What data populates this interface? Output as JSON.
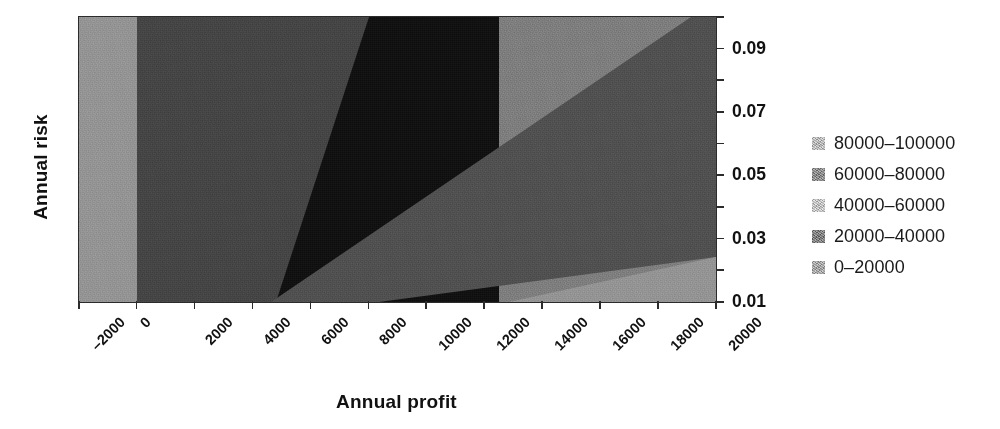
{
  "chart_data": {
    "type": "heatmap",
    "subtype": "filled-contour",
    "title": "",
    "xlabel": "Annual profit",
    "ylabel": "Annual risk",
    "xlim": [
      -2000,
      20000
    ],
    "ylim": [
      0.01,
      0.1
    ],
    "grid": false,
    "y_axis_position": "right",
    "x_tick_rotation": -45,
    "xticks": [
      "-2000",
      "0",
      "2000",
      "4000",
      "6000",
      "8000",
      "10000",
      "12000",
      "14000",
      "16000",
      "18000",
      "20000"
    ],
    "xtick_values": [
      -2000,
      0,
      2000,
      4000,
      6000,
      8000,
      10000,
      12000,
      14000,
      16000,
      18000,
      20000
    ],
    "yticks": [
      "0.01",
      "0.03",
      "0.05",
      "0.07",
      "0.09"
    ],
    "ytick_values": [
      0.01,
      0.03,
      0.05,
      0.07,
      0.09
    ],
    "yminor_values": [
      0.02,
      0.04,
      0.06,
      0.08,
      0.1
    ],
    "zlabel": "Expected value",
    "levels": [
      0,
      20000,
      40000,
      60000,
      80000,
      100000
    ],
    "band_colors": [
      "#969696",
      "#444444",
      "#7f7f7f",
      "#4f4f4f",
      "#0e0e0e"
    ],
    "legend_position": "right",
    "legend": [
      {
        "label": "80000–100000",
        "color": "#cfcfcf",
        "range": [
          80000,
          100000
        ]
      },
      {
        "label": "60000–80000",
        "color": "#8d8d8d",
        "range": [
          60000,
          80000
        ]
      },
      {
        "label": "40000–60000",
        "color": "#dcdcdc",
        "range": [
          40000,
          60000
        ]
      },
      {
        "label": "20000–40000",
        "color": "#7c7c7c",
        "range": [
          20000,
          40000
        ]
      },
      {
        "label": "0–20000",
        "color": "#b3b3b3",
        "range": [
          0,
          20000
        ]
      }
    ],
    "regions": [
      {
        "band": "0–20000",
        "color": "#969696",
        "description": "leftmost vertical strip for profit below 0, spanning all risk values"
      },
      {
        "band": "20000–40000",
        "color": "#444444",
        "description": "dark band from profit 0 rising to the right with increasing risk"
      },
      {
        "band": "60000–80000",
        "color": "#0e0e0e",
        "description": "darkest wedge peaking near profit 6000–9000"
      },
      {
        "band": "40000–60000",
        "color": "#7f7f7f",
        "description": "light diagonal band from profit ~9000 toward upper right"
      },
      {
        "band": "20000–40000",
        "color": "#4f4f4f",
        "description": "medium-dark diagonal band lower right, from profit ~13000 at low risk to ~20000 at high risk"
      },
      {
        "band": "0–20000",
        "color": "#969696",
        "description": "light corner region at bottom right beyond profit ~18000"
      }
    ]
  },
  "axes": {
    "xlabel": "Annual profit",
    "ylabel": "Annual risk"
  }
}
